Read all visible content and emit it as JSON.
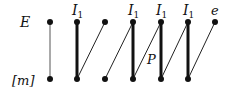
{
  "diagram": {
    "row_labels": {
      "top": "E",
      "bottom": "[m]"
    },
    "column_labels": [
      {
        "col": 1,
        "text": "I",
        "sub": "1"
      },
      {
        "col": 3,
        "text": "I",
        "sub": "1"
      },
      {
        "col": 4,
        "text": "I",
        "sub": "1"
      },
      {
        "col": 5,
        "text": "I",
        "sub": "1"
      },
      {
        "col": 6,
        "text": "e",
        "sub": ""
      }
    ],
    "edge_label": "P",
    "top_nodes_x": [
      50,
      77,
      105,
      133,
      161,
      188,
      215
    ],
    "bottom_nodes_x": [
      50,
      77,
      105,
      133,
      161,
      188
    ],
    "vertical_edges": [
      {
        "col": 0,
        "weight": "thin"
      },
      {
        "col": 1,
        "weight": "thick"
      },
      {
        "col": 3,
        "weight": "thick"
      },
      {
        "col": 4,
        "weight": "thick"
      },
      {
        "col": 5,
        "weight": "thick"
      }
    ],
    "diagonal_edges": [
      {
        "from_bottom": 1,
        "to_top": 2
      },
      {
        "from_bottom": 2,
        "to_top": 3
      },
      {
        "from_bottom": 3,
        "to_top": 4
      },
      {
        "from_bottom": 4,
        "to_top": 5
      },
      {
        "from_bottom": 5,
        "to_top": 6
      }
    ]
  }
}
